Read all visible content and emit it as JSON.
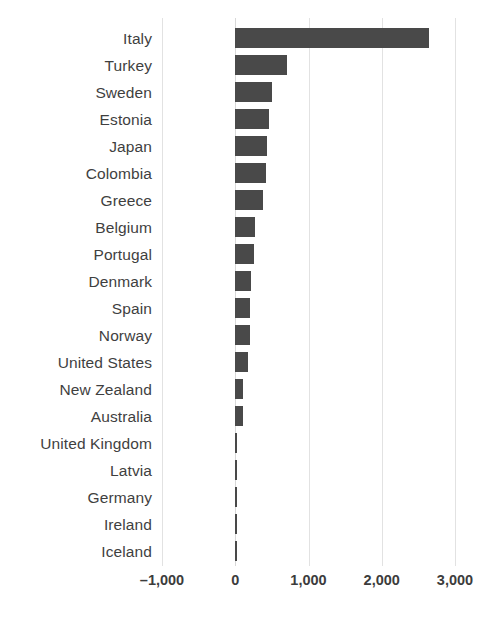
{
  "chart_data": {
    "type": "bar",
    "orientation": "horizontal",
    "title": "",
    "subtitle": "",
    "xlabel": "",
    "ylabel": "",
    "xlim": [
      -1000,
      3000
    ],
    "xticks": [
      -1000,
      0,
      1000,
      2000,
      3000
    ],
    "xticklabels": [
      "–1,000",
      "0",
      "1,000",
      "2,000",
      "3,000"
    ],
    "grid": "vertical",
    "legend": "none",
    "bar_color": "#494949",
    "gridline_color": "#e2e2e2",
    "categories": [
      "Italy",
      "Turkey",
      "Sweden",
      "Estonia",
      "Japan",
      "Colombia",
      "Greece",
      "Belgium",
      "Portugal",
      "Denmark",
      "Spain",
      "Norway",
      "United States",
      "New Zealand",
      "Australia",
      "United Kingdom",
      "Latvia",
      "Germany",
      "Ireland",
      "Iceland"
    ],
    "values": [
      2640,
      707,
      505,
      465,
      435,
      425,
      380,
      270,
      260,
      215,
      205,
      195,
      175,
      110,
      105,
      10,
      8,
      6,
      5,
      5
    ]
  },
  "top_artifact": {
    "text": ""
  }
}
